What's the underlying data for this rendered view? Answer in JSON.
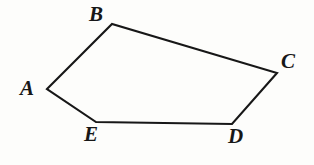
{
  "figure": {
    "name": "pentagon-abcde",
    "caption": "",
    "background_color": "#fdfdfb",
    "stroke_color": "#171717",
    "stroke_width": 2.1,
    "canvas": {
      "width": 314,
      "height": 165
    },
    "vertices": [
      {
        "id": "A",
        "label": "A",
        "x": 47,
        "y": 89,
        "label_x": 20,
        "label_y": 78
      },
      {
        "id": "B",
        "label": "B",
        "x": 112,
        "y": 24,
        "label_x": 89,
        "label_y": 4
      },
      {
        "id": "C",
        "label": "C",
        "x": 277,
        "y": 73,
        "label_x": 281,
        "label_y": 51
      },
      {
        "id": "D",
        "label": "D",
        "x": 232,
        "y": 124,
        "label_x": 228,
        "label_y": 126
      },
      {
        "id": "E",
        "label": "E",
        "x": 96,
        "y": 122,
        "label_x": 84,
        "label_y": 124
      }
    ],
    "edges": [
      {
        "from": "A",
        "to": "B"
      },
      {
        "from": "B",
        "to": "C"
      },
      {
        "from": "C",
        "to": "D"
      },
      {
        "from": "D",
        "to": "E"
      },
      {
        "from": "E",
        "to": "A"
      }
    ],
    "path": "M 47 89 L 112 24 L 277 73 L 232 124 L 96 122 Z"
  }
}
